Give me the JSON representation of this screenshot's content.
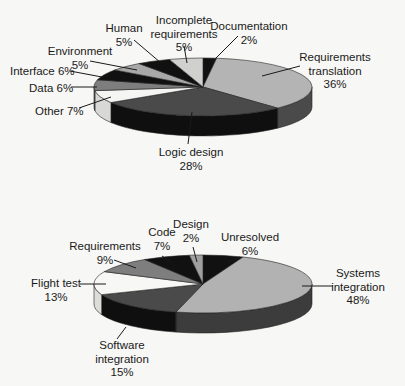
{
  "chart_data": [
    {
      "type": "pie",
      "title": "",
      "style": "3d-exploded-free",
      "center": [
        203,
        87
      ],
      "rx": 109,
      "ry": 29,
      "depth": 20,
      "start_angle_deg": 0,
      "slices": [
        {
          "label": "Documentation",
          "pct_label": "2%",
          "value": 2,
          "color": "#111111",
          "side": "#0d0d0d",
          "text": [
            "Documentation",
            "2%"
          ],
          "tx": 249,
          "ty": 30,
          "anchor": "middle",
          "leader": [
            [
              238,
              36
            ],
            [
              212,
              62
            ]
          ]
        },
        {
          "label": "Requirements translation",
          "pct_label": "36%",
          "value": 36,
          "color": "#b4b4b4",
          "side": "#4a4a4a",
          "text": [
            "Requirements",
            "translation",
            "36%"
          ],
          "tx": 335,
          "ty": 61,
          "anchor": "middle",
          "leader": [
            [
              300,
              66
            ],
            [
              262,
              76
            ]
          ]
        },
        {
          "label": "Logic design",
          "pct_label": "28%",
          "value": 28,
          "color": "#4a4a4a",
          "side": "#0f0f0f",
          "text": [
            "Logic design",
            "28%"
          ],
          "tx": 191,
          "ty": 156,
          "anchor": "middle",
          "leader": [
            [
              188,
              144
            ],
            [
              192,
              112
            ]
          ]
        },
        {
          "label": "Other",
          "pct_label": "7%",
          "value": 7,
          "color": "#f5f5f3",
          "side": "#d8d8d6",
          "text": [
            "Other 7%"
          ],
          "tx": 35,
          "ty": 115,
          "anchor": "start",
          "leader": [
            [
              79,
              108
            ],
            [
              111,
              97
            ]
          ]
        },
        {
          "label": "Data",
          "pct_label": "6%",
          "value": 6,
          "color": "#7e7e7e",
          "side": "#5a5a5a",
          "text": [
            "Data 6%"
          ],
          "tx": 29,
          "ty": 92,
          "anchor": "start",
          "leader": [
            [
              71,
              87
            ],
            [
              97,
              87
            ]
          ]
        },
        {
          "label": "Interface",
          "pct_label": "6%",
          "value": 6,
          "color": "#111111",
          "side": "#0d0d0d",
          "text": [
            "Interface 6%"
          ],
          "tx": 10,
          "ty": 75,
          "anchor": "start",
          "leader": [
            [
              70,
              71
            ],
            [
              102,
              77
            ]
          ]
        },
        {
          "label": "Environment",
          "pct_label": "5%",
          "value": 5,
          "color": "#a8a8a8",
          "side": "#808080",
          "text": [
            "Environment",
            "5%"
          ],
          "tx": 80,
          "ty": 55,
          "anchor": "middle",
          "leader": [
            [
              90,
              61
            ],
            [
              137,
              70
            ]
          ]
        },
        {
          "label": "Human",
          "pct_label": "5%",
          "value": 5,
          "color": "#111111",
          "side": "#0d0d0d",
          "text": [
            "Human",
            "5%"
          ],
          "tx": 124,
          "ty": 32,
          "anchor": "middle",
          "leader": [
            [
              134,
              40
            ],
            [
              161,
              63
            ]
          ]
        },
        {
          "label": "Incomplete requirements",
          "pct_label": "5%",
          "value": 5,
          "color": "#d0d0ce",
          "side": "#a0a0a0",
          "text": [
            "Incomplete",
            "requirements",
            "5%"
          ],
          "tx": 184,
          "ty": 24,
          "anchor": "middle",
          "leader": [
            [
              184,
              46
            ],
            [
              187,
              63
            ]
          ]
        }
      ]
    },
    {
      "type": "pie",
      "title": "",
      "style": "3d-exploded-free",
      "center": [
        203,
        284
      ],
      "rx": 109,
      "ry": 29,
      "depth": 20,
      "start_angle_deg": 0,
      "slices": [
        {
          "label": "Unresolved",
          "pct_label": "6%",
          "value": 6,
          "color": "#111111",
          "side": "#0d0d0d",
          "text": [
            "Unresolved",
            "6%"
          ],
          "tx": 250,
          "ty": 241,
          "anchor": "middle",
          "leader": [
            [
              240,
              257
            ],
            [
              228,
              262
            ]
          ]
        },
        {
          "label": "Systems integration",
          "pct_label": "48%",
          "value": 48,
          "color": "#b2b2b2",
          "side": "#3c3c3c",
          "text": [
            "Systems",
            "integration",
            "48%"
          ],
          "tx": 358,
          "ty": 277,
          "anchor": "middle",
          "leader": [
            [
              333,
              286
            ],
            [
              302,
              286
            ]
          ]
        },
        {
          "label": "Software integration",
          "pct_label": "15%",
          "value": 15,
          "color": "#4a4a4a",
          "side": "#0f0f0f",
          "text": [
            "Software",
            "integration",
            "15%"
          ],
          "tx": 122,
          "ty": 349,
          "anchor": "middle",
          "leader": [
            [
              117,
              339
            ],
            [
              126,
              327
            ]
          ]
        },
        {
          "label": "Flight test",
          "pct_label": "13%",
          "value": 13,
          "color": "#f7f7f5",
          "side": "#dcdcda",
          "text": [
            "Flight test",
            "13%"
          ],
          "tx": 56,
          "ty": 287,
          "anchor": "middle",
          "leader": [
            [
              80,
              284
            ],
            [
              106,
              284
            ]
          ]
        },
        {
          "label": "Requirements",
          "pct_label": "9%",
          "value": 9,
          "color": "#7e7e7e",
          "side": "#5a5a5a",
          "text": [
            "Requirements",
            "9%"
          ],
          "tx": 105,
          "ty": 250,
          "anchor": "middle",
          "leader": [
            [
              114,
              260
            ],
            [
              136,
              268
            ]
          ]
        },
        {
          "label": "Code",
          "pct_label": "7%",
          "value": 7,
          "color": "#111111",
          "side": "#0d0d0d",
          "text": [
            "Code",
            "7%"
          ],
          "tx": 162,
          "ty": 236,
          "anchor": "middle",
          "leader": [
            [
              162,
              256
            ],
            [
              171,
              262
            ]
          ]
        },
        {
          "label": "Design",
          "pct_label": "2%",
          "value": 2,
          "color": "#a0a0a0",
          "side": "#707070",
          "text": [
            "Design",
            "2%"
          ],
          "tx": 191,
          "ty": 228,
          "anchor": "middle",
          "leader": [
            [
              193,
              247
            ],
            [
              197,
              262
            ]
          ]
        }
      ]
    }
  ]
}
